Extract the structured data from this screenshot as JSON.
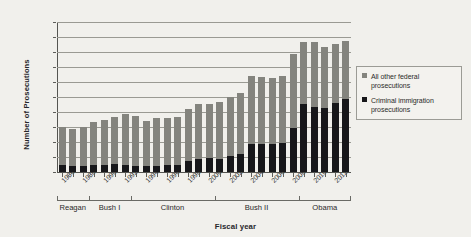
{
  "chart_data": {
    "type": "bar",
    "stacked": true,
    "title": "",
    "xlabel": "Fiscal year",
    "ylabel": "Number of Prosecutions",
    "ylim": [
      0,
      200000
    ],
    "ytick_step": 20000,
    "grid": true,
    "legend_position": "right",
    "ytick_labels": [
      "200,000",
      "180,000",
      "160,000",
      "140,000",
      "120,000",
      "100,000",
      "80,000",
      "60,000",
      "40,000",
      "20,000",
      "0"
    ],
    "categories": [
      1986,
      1987,
      1988,
      1989,
      1990,
      1991,
      1992,
      1993,
      1994,
      1995,
      1996,
      1997,
      1998,
      1999,
      2000,
      2001,
      2002,
      2003,
      2004,
      2005,
      2006,
      2007,
      2008,
      2009,
      2010,
      2011,
      2012,
      2013
    ],
    "xtick_labels": [
      "1986",
      "1988",
      "1990",
      "1992",
      "1994",
      "1996",
      "1998",
      "2000",
      "2002",
      "2004",
      "2006",
      "2008",
      "2010",
      "2012"
    ],
    "series": [
      {
        "name": "Criminal immigration prosecutions",
        "color": "#17171a",
        "values": [
          9000,
          8500,
          8500,
          9000,
          9500,
          11000,
          9500,
          8000,
          7500,
          8500,
          9000,
          9500,
          14500,
          18000,
          19000,
          17500,
          21000,
          24500,
          37000,
          37500,
          37500,
          38500,
          59000,
          91000,
          87000,
          85000,
          92000,
          97000
        ]
      },
      {
        "name": "All other federal prosecutions",
        "color": "#84847e",
        "values": [
          51000,
          49500,
          52000,
          58000,
          60500,
          62000,
          68000,
          67000,
          60500,
          64000,
          63500,
          64500,
          69500,
          72500,
          72000,
          75500,
          78500,
          81500,
          91000,
          89500,
          88500,
          89500,
          99000,
          82000,
          86000,
          82000,
          79000,
          78000
        ]
      }
    ],
    "totals": [
      60000,
      58000,
      60500,
      67000,
      70000,
      73000,
      77500,
      75000,
      68000,
      72500,
      72500,
      74000,
      84000,
      90500,
      91000,
      93000,
      99500,
      106000,
      128000,
      127000,
      126000,
      128000,
      158000,
      173000,
      173000,
      167000,
      171000,
      175000
    ],
    "presidential_terms": [
      {
        "label": "Reagan",
        "start_year": 1986,
        "end_year": 1988
      },
      {
        "label": "Bush I",
        "start_year": 1989,
        "end_year": 1992
      },
      {
        "label": "Clinton",
        "start_year": 1993,
        "end_year": 2000
      },
      {
        "label": "Bush II",
        "start_year": 2001,
        "end_year": 2008
      },
      {
        "label": "Obama",
        "start_year": 2009,
        "end_year": 2013
      }
    ]
  },
  "legend": {
    "items": [
      {
        "label": "All other federal prosecutions",
        "swatch": "gray-square-icon"
      },
      {
        "label": "Criminal immigration prosecutions",
        "swatch": "black-square-icon"
      }
    ]
  }
}
